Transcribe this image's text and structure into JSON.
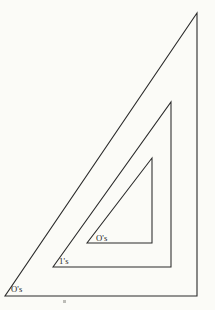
{
  "figure": {
    "background_color": "#fcfcfa",
    "line_color": "#2b2b2b",
    "text_color": "#1d1d1d",
    "width": 215,
    "height": 310,
    "shapes": [
      {
        "name": "outer-triangle",
        "type": "right-triangle",
        "points": "5,296 197,296 197,13",
        "vertices": {
          "bottom_left": [
            5,
            296
          ],
          "bottom_right": [
            197,
            296
          ],
          "top_right": [
            197,
            13
          ]
        }
      },
      {
        "name": "middle-triangle",
        "type": "right-triangle",
        "points": "53,267 171,267 171,102",
        "vertices": {
          "bottom_left": [
            53,
            267
          ],
          "bottom_right": [
            171,
            267
          ],
          "top_right": [
            171,
            102
          ]
        }
      },
      {
        "name": "inner-triangle",
        "type": "right-triangle",
        "points": "87,243 152,243 152,158",
        "vertices": {
          "bottom_left": [
            87,
            243
          ],
          "bottom_right": [
            152,
            243
          ],
          "top_right": [
            152,
            158
          ]
        }
      }
    ],
    "labels": [
      {
        "name": "outer-region-label",
        "text": "O's",
        "x": 11,
        "y": 292,
        "region": "outer-triangle"
      },
      {
        "name": "middle-region-label",
        "text": "1's",
        "x": 59,
        "y": 264,
        "region": "middle-triangle"
      },
      {
        "name": "inner-region-label",
        "text": "O's",
        "x": 96,
        "y": 241,
        "region": "inner-triangle"
      }
    ],
    "artifacts": [
      {
        "name": "scan-speck",
        "x": 63,
        "y": 300,
        "width": 3,
        "height": 3
      }
    ]
  }
}
